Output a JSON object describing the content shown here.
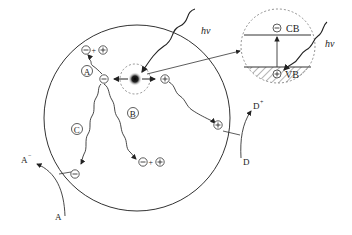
{
  "diagram": {
    "type": "semiconductor-photocatalysis",
    "colors": {
      "stroke": "#333333",
      "dashed": "#777777",
      "background": "#ffffff"
    },
    "labels": {
      "photon_main": "hν",
      "photon_inset": "hν",
      "conduction_band": "CB",
      "valence_band": "VB",
      "pathway_a": "A",
      "pathway_b": "B",
      "pathway_c": "C",
      "acceptor": "A",
      "acceptor_reduced": "A",
      "acceptor_sup": "−",
      "donor": "D",
      "donor_oxidized": "D",
      "donor_sup": "+",
      "electron": "⊖",
      "hole": "⊕",
      "plus": "+"
    }
  }
}
